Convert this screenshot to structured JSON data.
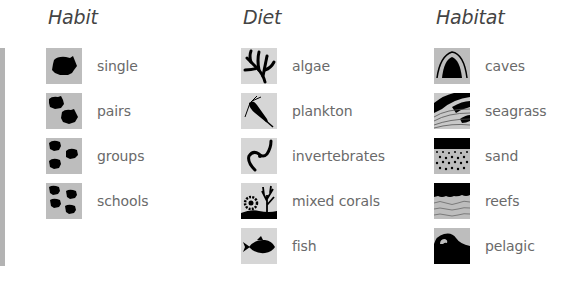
{
  "columns": {
    "habit": {
      "title": "Habit",
      "items": [
        {
          "label": "single",
          "icon": "single-fish-icon"
        },
        {
          "label": "pairs",
          "icon": "fish-pair-icon"
        },
        {
          "label": "groups",
          "icon": "fish-group-icon"
        },
        {
          "label": "schools",
          "icon": "fish-school-icon"
        }
      ]
    },
    "diet": {
      "title": "Diet",
      "items": [
        {
          "label": "algae",
          "icon": "algae-icon"
        },
        {
          "label": "plankton",
          "icon": "plankton-icon"
        },
        {
          "label": "invertebrates",
          "icon": "worm-icon"
        },
        {
          "label": "mixed corals",
          "icon": "coral-icon"
        },
        {
          "label": "fish",
          "icon": "fish-icon"
        }
      ]
    },
    "habitat": {
      "title": "Habitat",
      "items": [
        {
          "label": "caves",
          "icon": "cave-icon"
        },
        {
          "label": "seagrass",
          "icon": "seagrass-icon"
        },
        {
          "label": "sand",
          "icon": "sand-icon"
        },
        {
          "label": "reefs",
          "icon": "reef-icon"
        },
        {
          "label": "pelagic",
          "icon": "wave-icon"
        }
      ]
    }
  },
  "colors": {
    "icon_bg": "#bdbdbd",
    "icon_bg_light": "#d6d6d6",
    "icon_fg": "#000000",
    "label": "#6a6a6a",
    "title": "#444444",
    "side_bar": "#b3b3b3"
  }
}
